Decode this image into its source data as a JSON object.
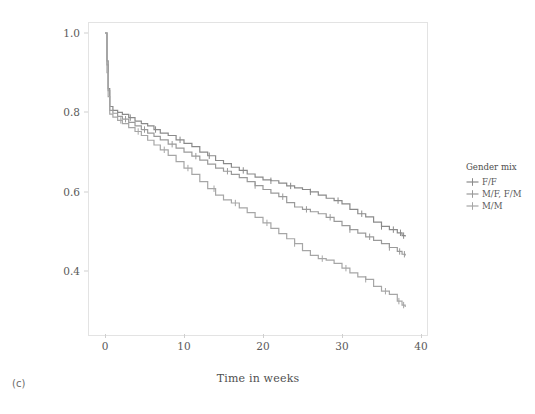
{
  "panel": {
    "label": "(c)"
  },
  "chart_data": {
    "type": "line",
    "subtype": "kaplan-meier-step",
    "title": "",
    "xlabel": "Time in weeks",
    "ylabel": "Survival probability",
    "xlim": [
      0,
      40
    ],
    "ylim": [
      0.28,
      1.0
    ],
    "xticks": [
      "0",
      "10",
      "20",
      "30",
      "40"
    ],
    "xtick_values": [
      0,
      10,
      20,
      30,
      40
    ],
    "yticks": [
      "0.4",
      "0.6",
      "0.8",
      "1.0"
    ],
    "ytick_values": [
      0.4,
      0.6,
      0.8,
      1.0
    ],
    "grid": false,
    "legend_position": "right",
    "legend_title": "Gender mix",
    "series": [
      {
        "name": "F/F",
        "color": "#8a8a8a",
        "points": [
          [
            0,
            1.0
          ],
          [
            0.25,
            0.93
          ],
          [
            0.4,
            0.86
          ],
          [
            0.6,
            0.815
          ],
          [
            1.0,
            0.805
          ],
          [
            1.6,
            0.8
          ],
          [
            2.2,
            0.795
          ],
          [
            3.0,
            0.787
          ],
          [
            3.8,
            0.778
          ],
          [
            4.6,
            0.772
          ],
          [
            5.4,
            0.766
          ],
          [
            6.2,
            0.757
          ],
          [
            7.0,
            0.748
          ],
          [
            8.0,
            0.742
          ],
          [
            9.0,
            0.731
          ],
          [
            10.0,
            0.722
          ],
          [
            11.0,
            0.714
          ],
          [
            12.0,
            0.7
          ],
          [
            13.0,
            0.691
          ],
          [
            14.0,
            0.679
          ],
          [
            15.0,
            0.671
          ],
          [
            16.0,
            0.662
          ],
          [
            17.0,
            0.654
          ],
          [
            18.0,
            0.645
          ],
          [
            19.0,
            0.637
          ],
          [
            20.0,
            0.63
          ],
          [
            21.0,
            0.628
          ],
          [
            22.0,
            0.622
          ],
          [
            23.0,
            0.615
          ],
          [
            24.0,
            0.61
          ],
          [
            25.0,
            0.606
          ],
          [
            26.0,
            0.6
          ],
          [
            27.0,
            0.592
          ],
          [
            28.0,
            0.584
          ],
          [
            29.0,
            0.578
          ],
          [
            30.0,
            0.57
          ],
          [
            31.0,
            0.556
          ],
          [
            32.0,
            0.545
          ],
          [
            33.0,
            0.537
          ],
          [
            34.0,
            0.524
          ],
          [
            35.0,
            0.513
          ],
          [
            36.0,
            0.505
          ],
          [
            37.0,
            0.497
          ],
          [
            37.6,
            0.49
          ],
          [
            38.0,
            0.488
          ]
        ],
        "censor_times": [
          3.2,
          6.4,
          9.5,
          13.2,
          17.5,
          21.0,
          23.5,
          26.0,
          29.5,
          32.5,
          35.0,
          36.5,
          37.4,
          37.8
        ],
        "final_value": 0.49
      },
      {
        "name": "M/F, F/M",
        "color": "#9a9a9a",
        "points": [
          [
            0,
            1.0
          ],
          [
            0.25,
            0.92
          ],
          [
            0.4,
            0.855
          ],
          [
            0.6,
            0.805
          ],
          [
            1.0,
            0.798
          ],
          [
            1.6,
            0.79
          ],
          [
            2.2,
            0.783
          ],
          [
            3.0,
            0.775
          ],
          [
            3.8,
            0.766
          ],
          [
            4.6,
            0.757
          ],
          [
            5.4,
            0.748
          ],
          [
            6.2,
            0.74
          ],
          [
            7.0,
            0.731
          ],
          [
            8.0,
            0.72
          ],
          [
            9.0,
            0.71
          ],
          [
            10.0,
            0.7
          ],
          [
            11.0,
            0.69
          ],
          [
            12.0,
            0.68
          ],
          [
            13.0,
            0.67
          ],
          [
            14.0,
            0.66
          ],
          [
            15.0,
            0.652
          ],
          [
            16.0,
            0.644
          ],
          [
            17.0,
            0.636
          ],
          [
            18.0,
            0.626
          ],
          [
            19.0,
            0.616
          ],
          [
            20.0,
            0.606
          ],
          [
            21.0,
            0.597
          ],
          [
            22.0,
            0.588
          ],
          [
            23.0,
            0.573
          ],
          [
            24.0,
            0.562
          ],
          [
            25.0,
            0.556
          ],
          [
            26.0,
            0.55
          ],
          [
            27.0,
            0.545
          ],
          [
            28.0,
            0.536
          ],
          [
            29.0,
            0.526
          ],
          [
            30.0,
            0.515
          ],
          [
            31.0,
            0.505
          ],
          [
            32.0,
            0.496
          ],
          [
            33.0,
            0.487
          ],
          [
            34.0,
            0.478
          ],
          [
            35.0,
            0.47
          ],
          [
            36.0,
            0.46
          ],
          [
            37.0,
            0.45
          ],
          [
            37.6,
            0.443
          ],
          [
            38.0,
            0.44
          ]
        ],
        "censor_times": [
          2.6,
          5.0,
          8.5,
          11.5,
          15.5,
          19.0,
          22.5,
          25.5,
          28.5,
          31.0,
          33.5,
          36.0,
          37.3,
          37.9
        ],
        "final_value": 0.44
      },
      {
        "name": "M/M",
        "color": "#a6a6a6",
        "points": [
          [
            0,
            1.0
          ],
          [
            0.25,
            0.9
          ],
          [
            0.4,
            0.84
          ],
          [
            0.6,
            0.796
          ],
          [
            1.0,
            0.788
          ],
          [
            1.6,
            0.78
          ],
          [
            2.2,
            0.772
          ],
          [
            3.0,
            0.762
          ],
          [
            3.8,
            0.752
          ],
          [
            4.6,
            0.742
          ],
          [
            5.4,
            0.73
          ],
          [
            6.2,
            0.718
          ],
          [
            7.0,
            0.706
          ],
          [
            8.0,
            0.692
          ],
          [
            9.0,
            0.676
          ],
          [
            10.0,
            0.66
          ],
          [
            11.0,
            0.644
          ],
          [
            12.0,
            0.626
          ],
          [
            13.0,
            0.608
          ],
          [
            14.0,
            0.592
          ],
          [
            15.0,
            0.58
          ],
          [
            16.0,
            0.572
          ],
          [
            17.0,
            0.56
          ],
          [
            18.0,
            0.548
          ],
          [
            19.0,
            0.536
          ],
          [
            20.0,
            0.522
          ],
          [
            21.0,
            0.508
          ],
          [
            22.0,
            0.495
          ],
          [
            23.0,
            0.482
          ],
          [
            24.0,
            0.47
          ],
          [
            25.0,
            0.452
          ],
          [
            26.0,
            0.44
          ],
          [
            27.0,
            0.432
          ],
          [
            28.0,
            0.428
          ],
          [
            29.0,
            0.42
          ],
          [
            30.0,
            0.408
          ],
          [
            31.0,
            0.396
          ],
          [
            32.0,
            0.386
          ],
          [
            33.0,
            0.38
          ],
          [
            34.0,
            0.362
          ],
          [
            35.0,
            0.35
          ],
          [
            36.0,
            0.342
          ],
          [
            37.0,
            0.325
          ],
          [
            37.6,
            0.315
          ],
          [
            38.0,
            0.31
          ]
        ],
        "censor_times": [
          2.0,
          4.2,
          7.5,
          10.5,
          13.8,
          16.5,
          20.5,
          24.0,
          27.5,
          30.5,
          33.0,
          35.5,
          37.2,
          37.8
        ],
        "final_value": 0.31
      }
    ]
  },
  "legend": {
    "title": "Gender mix",
    "items": [
      {
        "label": "F/F",
        "color": "#8a8a8a"
      },
      {
        "label": "M/F, F/M",
        "color": "#9a9a9a"
      },
      {
        "label": "M/M",
        "color": "#a6a6a6"
      }
    ]
  }
}
